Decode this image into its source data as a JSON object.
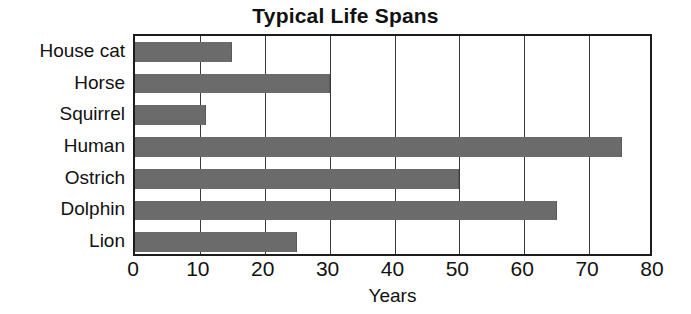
{
  "chart_data": {
    "type": "bar",
    "orientation": "horizontal",
    "title": "Typical Life Spans",
    "xlabel": "Years",
    "ylabel": "",
    "categories": [
      "House cat",
      "Horse",
      "Squirrel",
      "Human",
      "Ostrich",
      "Dolphin",
      "Lion"
    ],
    "values": [
      15,
      30,
      11,
      75,
      50,
      65,
      25
    ],
    "xlim": [
      0,
      80
    ],
    "xticks": [
      0,
      10,
      20,
      30,
      40,
      50,
      60,
      70,
      80
    ],
    "xtick_labels": [
      "0",
      "10",
      "20",
      "30",
      "40",
      "50",
      "60",
      "70",
      "80"
    ],
    "grid": true,
    "grid_axis": "x",
    "legend": false,
    "bar_color": "#6b6b6b",
    "frame_color": "#1c1c1c",
    "background": "#ffffff"
  }
}
